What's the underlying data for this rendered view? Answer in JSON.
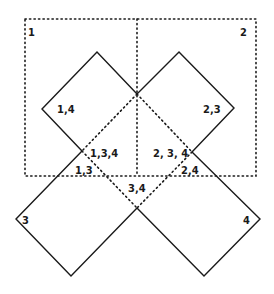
{
  "diagram": {
    "title": "",
    "regions": {
      "rect_1": "1",
      "rect_2": "2",
      "square_3": "3",
      "square_4": "4"
    },
    "labels": {
      "r1": "1",
      "r2": "2",
      "s14": "1,4",
      "s23": "2,3",
      "s134": "1,3,4",
      "s234": "2, 3, 4",
      "s13": "1,3",
      "s24": "2,4",
      "s34": "3,4",
      "s3": "3",
      "s4": "4"
    },
    "colors": {
      "stroke": "#1a1a1a",
      "background": "#ffffff"
    }
  }
}
